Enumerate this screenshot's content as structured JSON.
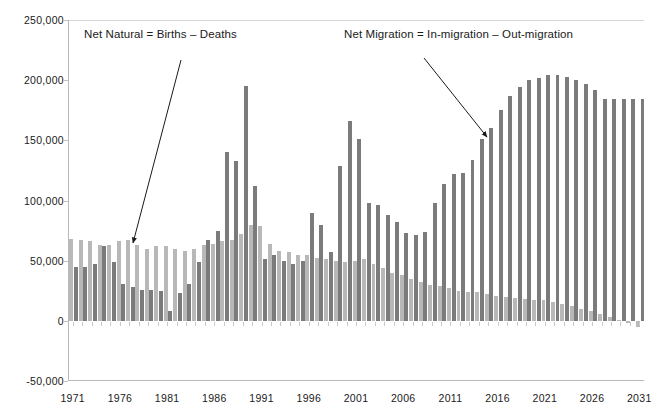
{
  "chart_data": {
    "type": "bar",
    "title": "",
    "subtitle": "",
    "xlabel": "",
    "ylabel": "",
    "ylim": [
      -50000,
      250000
    ],
    "xlim": [
      1971,
      2031
    ],
    "grid": false,
    "legend_position": "none",
    "y_ticks": [
      250000,
      200000,
      150000,
      100000,
      50000,
      0,
      -50000
    ],
    "y_tick_labels": [
      "250,000",
      "200,000",
      "150,000",
      "100,000",
      "50,000",
      "0",
      "-50,000"
    ],
    "x_tick_labels": [
      "1971",
      "1976",
      "1981",
      "1986",
      "1991",
      "1996",
      "2001",
      "2006",
      "2011",
      "2016",
      "2021",
      "2026",
      "2031"
    ],
    "x": [
      1971,
      1972,
      1973,
      1974,
      1975,
      1976,
      1977,
      1978,
      1979,
      1980,
      1981,
      1982,
      1983,
      1984,
      1985,
      1986,
      1987,
      1988,
      1989,
      1990,
      1991,
      1992,
      1993,
      1994,
      1995,
      1996,
      1997,
      1998,
      1999,
      2000,
      2001,
      2002,
      2003,
      2004,
      2005,
      2006,
      2007,
      2008,
      2009,
      2010,
      2011,
      2012,
      2013,
      2014,
      2015,
      2016,
      2017,
      2018,
      2019,
      2020,
      2021,
      2022,
      2023,
      2024,
      2025,
      2026,
      2027,
      2028,
      2029,
      2030,
      2031
    ],
    "series": [
      {
        "name": "Net Natural = Births – Deaths",
        "color": "#b8b8b8",
        "values": [
          68000,
          67000,
          66000,
          63000,
          63000,
          66000,
          67000,
          63000,
          60000,
          62000,
          62000,
          60000,
          58000,
          60000,
          63000,
          64000,
          66000,
          67000,
          72000,
          80000,
          79000,
          64000,
          58000,
          57000,
          55000,
          55000,
          52000,
          51000,
          50000,
          49000,
          50000,
          51000,
          47000,
          44000,
          40000,
          38000,
          35000,
          32000,
          30000,
          29000,
          27000,
          25000,
          24000,
          24000,
          22000,
          21000,
          20000,
          19000,
          18000,
          17000,
          17000,
          16000,
          14000,
          12000,
          10000,
          8000,
          6000,
          3000,
          1000,
          -2000,
          -5000
        ]
      },
      {
        "name": "Net Migration = In-migration – Out-migration",
        "color": "#7b7b7b",
        "values": [
          45000,
          45000,
          47000,
          62000,
          49000,
          31000,
          28000,
          26000,
          26000,
          25000,
          8000,
          23000,
          31000,
          49000,
          67000,
          75000,
          140000,
          133000,
          195000,
          112000,
          51000,
          55000,
          50000,
          47000,
          50000,
          90000,
          80000,
          57000,
          129000,
          166000,
          151000,
          98000,
          96000,
          88000,
          82000,
          73000,
          71000,
          74000,
          98000,
          114000,
          122000,
          123000,
          134000,
          151000,
          160000,
          175000,
          187000,
          194000,
          200000,
          202000,
          204000,
          204000,
          203000,
          200000,
          197000,
          192000,
          184000,
          184000,
          184000,
          184000,
          184000
        ]
      }
    ],
    "annotations": [
      {
        "id": "annotation-natural",
        "text": "Net Natural = Births – Deaths",
        "arrow_from": [
          181,
          60
        ],
        "arrow_to": [
          133,
          243
        ]
      },
      {
        "id": "annotation-migration",
        "text": "Net Migration = In-migration – Out-migration",
        "arrow_from": [
          424,
          58
        ],
        "arrow_to": [
          487,
          137
        ]
      }
    ]
  }
}
